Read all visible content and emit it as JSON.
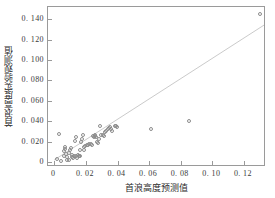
{
  "chart_data": {
    "type": "scatter",
    "title": "",
    "xlabel": "首浪高度预测值",
    "ylabel": "首浪高度实验观测值",
    "xlim": [
      -0.004,
      0.134
    ],
    "ylim": [
      -0.005,
      0.152
    ],
    "grid": false,
    "legend": null,
    "xticks": [
      0,
      0.02,
      0.04,
      0.06,
      0.08,
      0.1,
      0.12
    ],
    "xtick_labels": [
      "0",
      "0. 02",
      "0. 04",
      "0. 06",
      "0. 08",
      "0. 10",
      "0. 12"
    ],
    "yticks": [
      0,
      0.02,
      0.04,
      0.06,
      0.08,
      0.1,
      0.12,
      0.14
    ],
    "ytick_labels": [
      "0",
      "0. 020",
      "0. 040",
      "0. 060",
      "0. 080",
      "0. 100",
      "0. 120",
      "0. 140"
    ],
    "marker_style": "open-circle",
    "marker_color": "#8d8d8d",
    "reference_line": {
      "name": "y = x",
      "color": "#c9c9c9",
      "x": [
        0,
        0.134
      ],
      "y": [
        0,
        0.134
      ]
    },
    "points": [
      {
        "x": 0.003,
        "y": 0.027
      },
      {
        "x": 0.002,
        "y": 0.003
      },
      {
        "x": 0.0045,
        "y": 0.001
      },
      {
        "x": 0.006,
        "y": 0.006
      },
      {
        "x": 0.0062,
        "y": 0.0105
      },
      {
        "x": 0.0065,
        "y": 0.013
      },
      {
        "x": 0.0068,
        "y": 0.0145
      },
      {
        "x": 0.0072,
        "y": 0.0075
      },
      {
        "x": 0.0078,
        "y": 0.005
      },
      {
        "x": 0.0082,
        "y": 0.0018
      },
      {
        "x": 0.009,
        "y": 0.0016
      },
      {
        "x": 0.0095,
        "y": 0.0088
      },
      {
        "x": 0.01,
        "y": 0.0115
      },
      {
        "x": 0.0105,
        "y": 0.014
      },
      {
        "x": 0.011,
        "y": 0.007
      },
      {
        "x": 0.0115,
        "y": 0.0048
      },
      {
        "x": 0.012,
        "y": 0.0038
      },
      {
        "x": 0.0125,
        "y": 0.006
      },
      {
        "x": 0.013,
        "y": 0.0205
      },
      {
        "x": 0.0135,
        "y": 0.024
      },
      {
        "x": 0.014,
        "y": 0.0055
      },
      {
        "x": 0.0145,
        "y": 0.0042
      },
      {
        "x": 0.015,
        "y": 0.0072
      },
      {
        "x": 0.0155,
        "y": 0.0062
      },
      {
        "x": 0.0158,
        "y": 0.0058
      },
      {
        "x": 0.0162,
        "y": 0.0056
      },
      {
        "x": 0.0165,
        "y": 0.012
      },
      {
        "x": 0.017,
        "y": 0.0198
      },
      {
        "x": 0.0175,
        "y": 0.0225
      },
      {
        "x": 0.018,
        "y": 0.026
      },
      {
        "x": 0.0185,
        "y": 0.015
      },
      {
        "x": 0.019,
        "y": 0.0112
      },
      {
        "x": 0.0195,
        "y": 0.016
      },
      {
        "x": 0.0205,
        "y": 0.0168
      },
      {
        "x": 0.0215,
        "y": 0.017
      },
      {
        "x": 0.0222,
        "y": 0.0172
      },
      {
        "x": 0.023,
        "y": 0.0175
      },
      {
        "x": 0.0238,
        "y": 0.0168
      },
      {
        "x": 0.0245,
        "y": 0.025
      },
      {
        "x": 0.025,
        "y": 0.0242
      },
      {
        "x": 0.0255,
        "y": 0.0258
      },
      {
        "x": 0.026,
        "y": 0.0262
      },
      {
        "x": 0.0265,
        "y": 0.0248
      },
      {
        "x": 0.027,
        "y": 0.0195
      },
      {
        "x": 0.0275,
        "y": 0.0182
      },
      {
        "x": 0.0282,
        "y": 0.0222
      },
      {
        "x": 0.0288,
        "y": 0.035
      },
      {
        "x": 0.0295,
        "y": 0.0262
      },
      {
        "x": 0.0305,
        "y": 0.0268
      },
      {
        "x": 0.0312,
        "y": 0.0255
      },
      {
        "x": 0.032,
        "y": 0.0292
      },
      {
        "x": 0.033,
        "y": 0.0305
      },
      {
        "x": 0.0338,
        "y": 0.0318
      },
      {
        "x": 0.0345,
        "y": 0.033
      },
      {
        "x": 0.0352,
        "y": 0.0338
      },
      {
        "x": 0.036,
        "y": 0.0322
      },
      {
        "x": 0.0368,
        "y": 0.03
      },
      {
        "x": 0.0385,
        "y": 0.0355
      },
      {
        "x": 0.0392,
        "y": 0.0352
      },
      {
        "x": 0.0398,
        "y": 0.0338
      },
      {
        "x": 0.0615,
        "y": 0.0318
      },
      {
        "x": 0.085,
        "y": 0.0398
      },
      {
        "x": 0.13,
        "y": 0.145
      }
    ]
  },
  "axes": {
    "x_title": "首浪高度预测值",
    "y_title": "首浪高度实验观测值"
  }
}
